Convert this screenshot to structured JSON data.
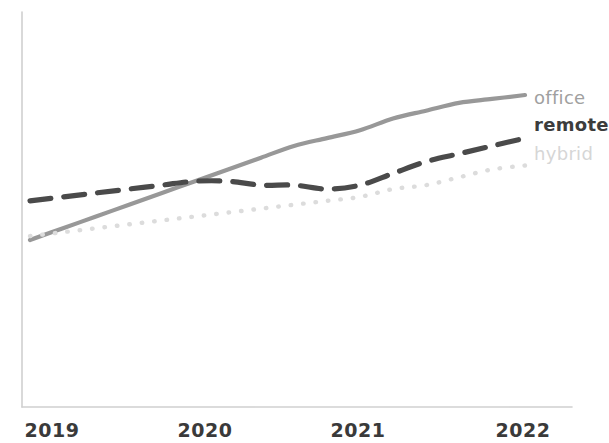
{
  "chart_data": {
    "type": "line",
    "title": "",
    "subtitle": "",
    "xlabel": "",
    "ylabel": "",
    "categories": [
      "2019",
      "2020",
      "2021",
      "2022"
    ],
    "x_tick_labels": [
      "2019",
      "2020",
      "2021",
      "2022"
    ],
    "xlim": [
      2019,
      2022
    ],
    "ylim": [
      0,
      100
    ],
    "grid": false,
    "legend_position": "right-inline-end-of-line",
    "axis_style": {
      "x_axis_visible": true,
      "y_axis_visible": true,
      "axis_color": "#cccccc",
      "ticks_visible": false,
      "y_tick_labels": []
    },
    "series": [
      {
        "name": "office",
        "label": "office",
        "color": "#989898",
        "style": "solid",
        "x": [
          2019,
          2019.2,
          2019.4,
          2019.6,
          2019.8,
          2020,
          2020.2,
          2020.4,
          2020.6,
          2020.8,
          2021,
          2021.2,
          2021.4,
          2021.6,
          2021.8,
          2022
        ],
        "values": [
          44,
          47,
          50,
          53,
          56,
          59,
          62,
          65,
          68,
          70,
          72,
          75,
          77,
          79,
          80,
          81
        ]
      },
      {
        "name": "remote",
        "label": "remote",
        "color": "#4a4a4a",
        "style": "dashed",
        "x": [
          2019,
          2019.2,
          2019.4,
          2019.6,
          2019.8,
          2020,
          2020.2,
          2020.4,
          2020.6,
          2020.8,
          2021,
          2021.2,
          2021.4,
          2021.6,
          2021.8,
          2022
        ],
        "values": [
          54,
          55,
          56,
          57,
          58,
          59,
          59,
          58,
          58,
          57,
          58,
          61,
          64,
          66,
          68,
          70
        ]
      },
      {
        "name": "hybrid",
        "label": "hybrid",
        "color": "#dcdcdc",
        "style": "dotted",
        "x": [
          2019,
          2019.2,
          2019.4,
          2019.6,
          2019.8,
          2020,
          2020.2,
          2020.4,
          2020.6,
          2020.8,
          2021,
          2021.2,
          2021.4,
          2021.6,
          2021.8,
          2022
        ],
        "values": [
          45,
          46,
          47,
          48,
          49,
          50,
          51,
          52,
          53,
          54,
          55,
          57,
          58,
          60,
          62,
          63
        ]
      }
    ]
  },
  "legend": {
    "office": "office",
    "remote": "remote",
    "hybrid": "hybrid"
  },
  "axis": {
    "tick_2019": "2019",
    "tick_2020": "2020",
    "tick_2021": "2021",
    "tick_2022": "2022"
  },
  "colors": {
    "office": "#989898",
    "remote": "#4a4a4a",
    "hybrid": "#dcdcdc",
    "axis": "#cccccc",
    "tick_text": "#3a3a3a",
    "background": "#ffffff"
  }
}
